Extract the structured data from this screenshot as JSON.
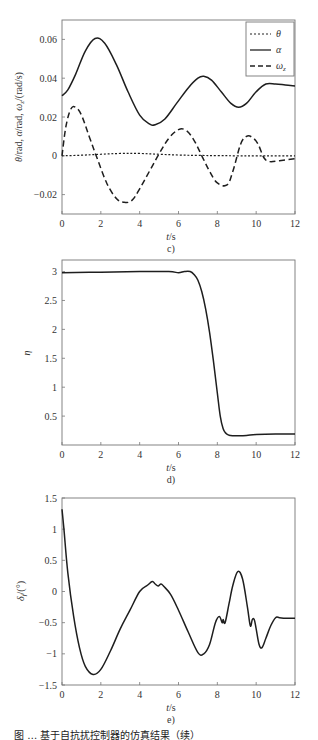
{
  "figure_caption": "图 … 基于自抗扰控制器的仿真结果（续）",
  "chart_data": [
    {
      "panel": "c)",
      "type": "line",
      "title": "",
      "xlabel": "t/s",
      "ylabel": "θ/rad, α/rad, ωz/(rad/s)",
      "xlim": [
        0,
        12
      ],
      "ylim": [
        -0.03,
        0.07
      ],
      "xticks": [
        0,
        2,
        4,
        6,
        8,
        10,
        12
      ],
      "yticks": [
        -0.02,
        0,
        0.02,
        0.04,
        0.06
      ],
      "ytick_labels": [
        "−0.02",
        "0",
        "0.02",
        "0.04",
        "0.06"
      ],
      "grid": false,
      "legend_position": "upper right",
      "series": [
        {
          "name": "θ",
          "style": "dotted",
          "x": [
            0,
            1,
            2,
            3,
            4,
            5,
            6,
            7,
            8,
            9,
            10,
            11,
            12
          ],
          "y": [
            0,
            0.0003,
            0.0008,
            0.0012,
            0.0012,
            0.0008,
            0.0004,
            0.0002,
            0.0001,
            0,
            0,
            0,
            0
          ]
        },
        {
          "name": "α",
          "style": "solid",
          "x": [
            0,
            0.3,
            0.7,
            1.2,
            1.7,
            2.2,
            2.8,
            3.4,
            4.0,
            4.5,
            4.8,
            5.3,
            5.9,
            6.5,
            7.0,
            7.3,
            7.7,
            8.2,
            8.7,
            9.1,
            9.5,
            10.0,
            10.5,
            11.0,
            11.5,
            12
          ],
          "y": [
            0.031,
            0.034,
            0.042,
            0.054,
            0.0605,
            0.058,
            0.047,
            0.033,
            0.021,
            0.0165,
            0.016,
            0.019,
            0.027,
            0.035,
            0.04,
            0.041,
            0.039,
            0.033,
            0.027,
            0.025,
            0.027,
            0.033,
            0.037,
            0.037,
            0.0365,
            0.036
          ]
        },
        {
          "name": "ωz",
          "style": "dashed",
          "x": [
            0,
            0.2,
            0.45,
            0.7,
            1.0,
            1.4,
            1.8,
            2.3,
            2.8,
            3.2,
            3.6,
            4.0,
            4.5,
            5.0,
            5.5,
            6.0,
            6.4,
            6.8,
            7.2,
            7.6,
            8.0,
            8.5,
            8.8,
            9.2,
            9.5,
            9.8,
            10.1,
            10.4,
            10.7,
            11.2,
            12
          ],
          "y": [
            0,
            0.015,
            0.024,
            0.025,
            0.021,
            0.01,
            -0.001,
            -0.014,
            -0.022,
            -0.024,
            -0.023,
            -0.017,
            -0.008,
            0.001,
            0.009,
            0.0135,
            0.013,
            0.008,
            0.0,
            -0.008,
            -0.014,
            -0.015,
            -0.008,
            0.006,
            0.01,
            0.0095,
            0.006,
            -0.001,
            -0.003,
            -0.0025,
            -0.0015
          ]
        }
      ]
    },
    {
      "panel": "d)",
      "type": "line",
      "title": "",
      "xlabel": "t/s",
      "ylabel": "η",
      "xlim": [
        0,
        12
      ],
      "ylim": [
        0,
        3.2
      ],
      "xticks": [
        0,
        2,
        4,
        6,
        8,
        10,
        12
      ],
      "yticks": [
        0.5,
        1,
        1.5,
        2,
        2.5,
        3
      ],
      "ytick_labels": [
        "0.5",
        "1",
        "1.5",
        "2",
        "2.5",
        "3"
      ],
      "grid": false,
      "series": [
        {
          "name": "η",
          "style": "solid",
          "x": [
            0,
            2,
            4,
            5.5,
            6.0,
            6.3,
            6.6,
            6.8,
            7.0,
            7.2,
            7.4,
            7.6,
            7.8,
            8.0,
            8.15,
            8.3,
            8.45,
            8.6,
            8.8,
            9.0,
            9.5,
            10,
            11,
            12
          ],
          "y": [
            2.98,
            2.99,
            3.0,
            3.0,
            2.98,
            3.0,
            3.0,
            2.95,
            2.85,
            2.65,
            2.35,
            1.95,
            1.45,
            0.9,
            0.5,
            0.28,
            0.2,
            0.17,
            0.16,
            0.16,
            0.165,
            0.18,
            0.19,
            0.19
          ]
        }
      ]
    },
    {
      "panel": "e)",
      "type": "line",
      "title": "",
      "xlabel": "t/s",
      "ylabel": "δf/(°)",
      "xlim": [
        0,
        12
      ],
      "ylim": [
        -1.5,
        1.5
      ],
      "xticks": [
        0,
        2,
        4,
        6,
        8,
        10,
        12
      ],
      "yticks": [
        -1.5,
        -1,
        -0.5,
        0,
        0.5,
        1,
        1.5
      ],
      "ytick_labels": [
        "−1.5",
        "−1",
        "−0.5",
        "0",
        "0.5",
        "1",
        "1.5"
      ],
      "grid": false,
      "series": [
        {
          "name": "δf",
          "style": "solid",
          "x": [
            0,
            0.1,
            0.3,
            0.6,
            0.9,
            1.2,
            1.6,
            2.0,
            2.5,
            3.0,
            3.5,
            4.0,
            4.4,
            4.65,
            4.8,
            4.95,
            5.1,
            5.25,
            5.6,
            6.0,
            6.5,
            7.0,
            7.3,
            7.6,
            7.9,
            8.1,
            8.25,
            8.3,
            8.4,
            8.6,
            8.8,
            9.05,
            9.3,
            9.55,
            9.7,
            9.8,
            9.9,
            10.0,
            10.15,
            10.3,
            10.5,
            10.75,
            11.0,
            11.2,
            11.5,
            12
          ],
          "y": [
            1.32,
            1.0,
            0.3,
            -0.4,
            -0.9,
            -1.2,
            -1.33,
            -1.25,
            -0.95,
            -0.6,
            -0.3,
            0.0,
            0.1,
            0.16,
            0.12,
            0.09,
            0.12,
            0.08,
            -0.05,
            -0.3,
            -0.65,
            -0.98,
            -1.0,
            -0.85,
            -0.5,
            -0.4,
            -0.5,
            -0.45,
            -0.5,
            -0.2,
            0.1,
            0.32,
            0.2,
            -0.25,
            -0.55,
            -0.45,
            -0.45,
            -0.6,
            -0.85,
            -0.9,
            -0.75,
            -0.55,
            -0.42,
            -0.42,
            -0.43,
            -0.43
          ]
        }
      ]
    }
  ],
  "labels": {
    "c": {
      "caption": "c)",
      "xlabel": "t/s",
      "legend": [
        "θ",
        "α",
        "ωz"
      ]
    },
    "d": {
      "caption": "d)",
      "xlabel": "t/s",
      "ylabel": "η"
    },
    "e": {
      "caption": "e)",
      "xlabel": "t/s",
      "ylabel": "δf/(°)"
    }
  }
}
